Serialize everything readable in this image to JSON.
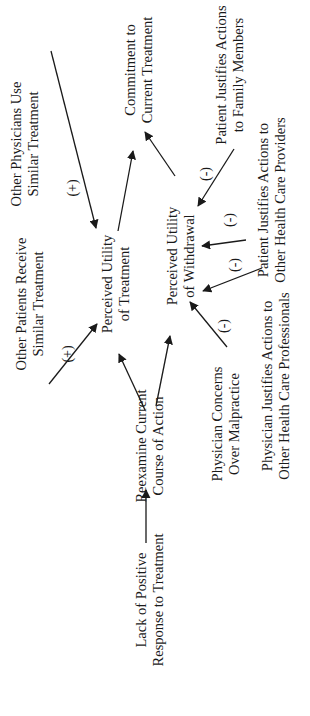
{
  "diagram": {
    "orientation": "rotated-90-ccw",
    "nodes": [
      {
        "id": "lack",
        "lines": [
          "Lack of Positive",
          "Response to Treatment"
        ]
      },
      {
        "id": "reexamine",
        "lines": [
          "Reexamine Current",
          "Course of Action"
        ]
      },
      {
        "id": "other_patients",
        "lines": [
          "Other Patients Receive",
          "Similar Treatment"
        ]
      },
      {
        "id": "pu_treatment",
        "lines": [
          "Perceived Utility",
          "of Treatment"
        ]
      },
      {
        "id": "other_physicians",
        "lines": [
          "Other Physicians Use",
          "Similar Treatment"
        ]
      },
      {
        "id": "commitment",
        "lines": [
          "Commitment to",
          "Current Treatment"
        ]
      },
      {
        "id": "pu_withdrawal",
        "lines": [
          "Perceived Utility",
          "of Withdrawal"
        ]
      },
      {
        "id": "patient_family",
        "lines": [
          "Patient Justifies Actions",
          "to Family Members"
        ]
      },
      {
        "id": "patient_providers",
        "lines": [
          "Patient Justifies Actions to",
          "Other Health Care Providers"
        ]
      },
      {
        "id": "physician_professionals",
        "lines": [
          "Physician Justifies Actions to",
          "Other Health Care Professionals"
        ]
      },
      {
        "id": "physician_malpractice",
        "lines": [
          "Physician Concerns",
          "Over Malpractice"
        ]
      }
    ],
    "edges": [
      {
        "from": "lack",
        "to": "reexamine",
        "sign": ""
      },
      {
        "from": "reexamine",
        "to": "pu_treatment",
        "sign": ""
      },
      {
        "from": "reexamine",
        "to": "pu_withdrawal",
        "sign": ""
      },
      {
        "from": "other_patients",
        "to": "pu_treatment",
        "sign": "(+)"
      },
      {
        "from": "other_physicians",
        "to": "pu_treatment",
        "sign": "(+)"
      },
      {
        "from": "pu_treatment",
        "to": "commitment",
        "sign": ""
      },
      {
        "from": "pu_withdrawal",
        "to": "commitment",
        "sign": ""
      },
      {
        "from": "patient_family",
        "to": "pu_withdrawal",
        "sign": "(-)"
      },
      {
        "from": "patient_providers",
        "to": "pu_withdrawal",
        "sign": "(-)"
      },
      {
        "from": "physician_professionals",
        "to": "pu_withdrawal",
        "sign": "(-)"
      },
      {
        "from": "physician_malpractice",
        "to": "pu_withdrawal",
        "sign": "(-)"
      }
    ],
    "signs": {
      "other_patients": "(+)",
      "other_physicians": "(+)",
      "patient_family": "(-)",
      "patient_providers": "(-)",
      "physician_professionals": "(-)",
      "physician_malpractice": "(-)"
    }
  }
}
